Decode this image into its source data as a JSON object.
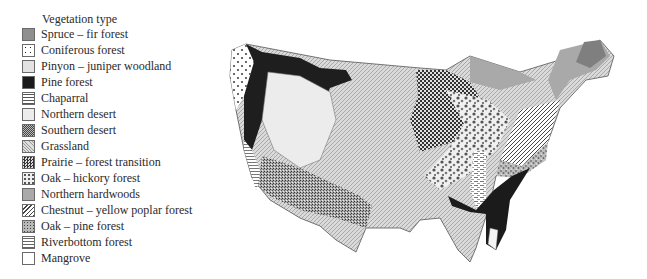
{
  "legend": {
    "title": "Vegetation type",
    "items": [
      {
        "label": "Spruce – fir forest",
        "pattern": "solid-gray",
        "color": "#8f8f8f"
      },
      {
        "label": "Coniferous forest",
        "pattern": "sparse-dots",
        "color": "#ffffff"
      },
      {
        "label": "Pinyon – juniper woodland",
        "pattern": "fine-stipple",
        "color": "#dcdcdc"
      },
      {
        "label": "Pine forest",
        "pattern": "solid-black",
        "color": "#1a1a1a"
      },
      {
        "label": "Chaparral",
        "pattern": "horizontal-lines",
        "color": "#f2f2f2"
      },
      {
        "label": "Northern desert",
        "pattern": "solid-light",
        "color": "#ececec"
      },
      {
        "label": "Southern desert",
        "pattern": "dense-stipple",
        "color": "#9a9a9a"
      },
      {
        "label": "Grassland",
        "pattern": "fine-hatch",
        "color": "#d4d4d4"
      },
      {
        "label": "Prairie – forest transition",
        "pattern": "checker",
        "color": "#555555"
      },
      {
        "label": "Oak – hickory forest",
        "pattern": "blotches",
        "color": "#c8c8c8"
      },
      {
        "label": "Northern hardwoods",
        "pattern": "solid-mid-gray",
        "color": "#a9a9a9"
      },
      {
        "label": "Chestnut – yellow poplar forest",
        "pattern": "diagonal-lines",
        "color": "#f0f0f0"
      },
      {
        "label": "Oak – pine forest",
        "pattern": "mottled",
        "color": "#b0b0b0"
      },
      {
        "label": "Riverbottom forest",
        "pattern": "dashed-lines",
        "color": "#f4f4f4"
      },
      {
        "label": "Mangrove",
        "pattern": "blank",
        "color": "#ffffff"
      }
    ]
  },
  "map": {
    "subject": "United States vegetation types",
    "regions": [
      {
        "name": "Pacific coast",
        "vegetation": "Coniferous forest"
      },
      {
        "name": "Cascades / Sierra",
        "vegetation": "Pine forest"
      },
      {
        "name": "Great Basin",
        "vegetation": "Northern desert"
      },
      {
        "name": "Southwest",
        "vegetation": "Southern desert"
      },
      {
        "name": "California",
        "vegetation": "Chaparral"
      },
      {
        "name": "Great Plains",
        "vegetation": "Grassland"
      },
      {
        "name": "Prairie margin",
        "vegetation": "Prairie – forest transition"
      },
      {
        "name": "Upper Midwest / Northeast",
        "vegetation": "Northern hardwoods"
      },
      {
        "name": "Maine / Adirondacks",
        "vegetation": "Spruce – fir forest"
      },
      {
        "name": "Ozarks / Ohio valley",
        "vegetation": "Oak – hickory forest"
      },
      {
        "name": "Appalachians",
        "vegetation": "Chestnut – yellow poplar forest"
      },
      {
        "name": "Piedmont",
        "vegetation": "Oak – pine forest"
      },
      {
        "name": "Mississippi valley",
        "vegetation": "Riverbottom forest"
      },
      {
        "name": "Southeast coastal plain",
        "vegetation": "Pine forest"
      },
      {
        "name": "South Florida",
        "vegetation": "Mangrove"
      }
    ]
  }
}
